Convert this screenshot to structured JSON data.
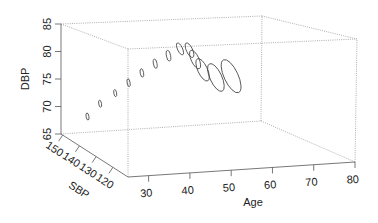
{
  "chart_data": {
    "type": "scatter",
    "subtype": "3d-scatter-ellipses",
    "title": "",
    "xlabel": "Age",
    "ylabel": "SBP",
    "zlabel": "DBP",
    "xlim": [
      25,
      80
    ],
    "ylim": [
      111,
      151
    ],
    "zlim": [
      65,
      85
    ],
    "x_ticks": [
      "30",
      "40",
      "50",
      "60",
      "70",
      "80"
    ],
    "y_ticks": [
      "150",
      "140",
      "130",
      "120"
    ],
    "z_ticks": [
      "65",
      "70",
      "75",
      "80",
      "85"
    ],
    "grid": false,
    "box": "dotted",
    "points": [
      {
        "age": 26.7,
        "sbp": 139,
        "dbp": 70.2,
        "size": 1
      },
      {
        "age": 30,
        "sbp": 139,
        "dbp": 72.3,
        "size": 1
      },
      {
        "age": 34,
        "sbp": 139,
        "dbp": 74.0,
        "size": 1
      },
      {
        "age": 37.5,
        "sbp": 139,
        "dbp": 75.7,
        "size": 1.1
      },
      {
        "age": 41,
        "sbp": 139,
        "dbp": 77.3,
        "size": 1.2
      },
      {
        "age": 44.5,
        "sbp": 139,
        "dbp": 78.8,
        "size": 1.3
      },
      {
        "age": 48,
        "sbp": 139,
        "dbp": 80.1,
        "size": 1.5
      },
      {
        "age": 51,
        "sbp": 139,
        "dbp": 81.2,
        "size": 1.8
      },
      {
        "age": 53.5,
        "sbp": 139,
        "dbp": 80.9,
        "size": 2.2
      },
      {
        "age": 55,
        "sbp": 139,
        "dbp": 79.2,
        "size": 2.8
      },
      {
        "age": 57,
        "sbp": 139,
        "dbp": 77.3,
        "size": 3.4
      },
      {
        "age": 60.5,
        "sbp": 139,
        "dbp": 75.8,
        "size": 4.2
      },
      {
        "age": 64.5,
        "sbp": 139,
        "dbp": 75.9,
        "size": 5.0
      }
    ]
  }
}
